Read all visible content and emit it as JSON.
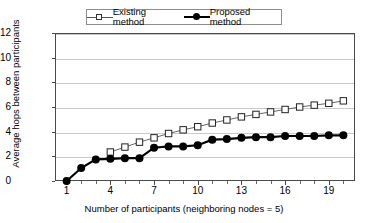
{
  "chart_data": {
    "type": "line",
    "title": "",
    "xlabel": "Number of participants (neighboring nodes = 5)",
    "ylabel": "Average hops between participants",
    "xlim": [
      0.2,
      20.8
    ],
    "ylim": [
      0,
      12
    ],
    "xticks": [
      1,
      4,
      7,
      10,
      13,
      16,
      19
    ],
    "xtick_labels": [
      "1",
      "4",
      "7",
      "10",
      "13",
      "16",
      "19"
    ],
    "yticks": [
      0,
      2,
      4,
      6,
      8,
      10,
      12
    ],
    "ytick_labels": [
      "0",
      "2",
      "4",
      "6",
      "8",
      "10",
      "12"
    ],
    "grid": "horizontal",
    "legend_position": "top-center",
    "series": [
      {
        "name": "Existing method",
        "marker": "open-square",
        "color": "#000000",
        "line_color": "#555555",
        "x": [
          4,
          5,
          6,
          7,
          8,
          9,
          10,
          11,
          12,
          13,
          14,
          15,
          16,
          17,
          18,
          19,
          20
        ],
        "values": [
          2.35,
          2.75,
          3.15,
          3.5,
          3.85,
          4.15,
          4.4,
          4.7,
          4.95,
          5.2,
          5.4,
          5.6,
          5.8,
          6.0,
          6.15,
          6.3,
          6.5
        ]
      },
      {
        "name": "Proposed method",
        "marker": "filled-circle",
        "color": "#000000",
        "line_color": "#000000",
        "x": [
          1,
          2,
          3,
          4,
          5,
          6,
          7,
          8,
          9,
          10,
          11,
          12,
          13,
          14,
          15,
          16,
          17,
          18,
          19,
          20
        ],
        "values": [
          0.0,
          1.05,
          1.75,
          1.8,
          1.85,
          1.85,
          2.7,
          2.8,
          2.8,
          2.9,
          3.35,
          3.4,
          3.5,
          3.55,
          3.55,
          3.65,
          3.65,
          3.65,
          3.7,
          3.7
        ]
      }
    ]
  },
  "legend": {
    "entries": [
      {
        "label": "Existing method"
      },
      {
        "label": "Proposed method"
      }
    ]
  }
}
